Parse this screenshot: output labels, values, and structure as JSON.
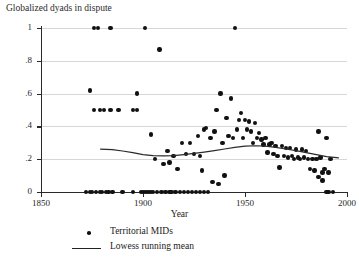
{
  "chart_data": {
    "type": "scatter",
    "title": "Globalized dyads in dispute",
    "xlabel": "Year",
    "ylabel": "",
    "xlim": [
      1850,
      2000
    ],
    "ylim": [
      0,
      1
    ],
    "grid": true,
    "legend_position": "below-axis",
    "xticks": [
      1850,
      1900,
      1950,
      2000
    ],
    "xtick_labels": [
      "1850",
      "1900",
      "1950",
      "2000"
    ],
    "yticks": [
      0,
      0.2,
      0.4,
      0.6,
      0.8,
      1
    ],
    "ytick_labels": [
      "0",
      ".2",
      ".4",
      ".6",
      ".8",
      "1"
    ],
    "legend": [
      {
        "label": "Territorial MIDs",
        "marker": "dot"
      },
      {
        "label": "Lowess running mean",
        "marker": "line"
      }
    ],
    "series": [
      {
        "name": "Territorial MIDs",
        "marker": "dot",
        "color": "#111111",
        "points": [
          [
            1876,
            1.0
          ],
          [
            1878,
            1.0
          ],
          [
            1884,
            1.0
          ],
          [
            1901,
            1.0
          ],
          [
            1945,
            1.0
          ],
          [
            1908,
            0.87
          ],
          [
            1874,
            0.62
          ],
          [
            1897,
            0.6
          ],
          [
            1938,
            0.6
          ],
          [
            1943,
            0.57
          ],
          [
            1876,
            0.5
          ],
          [
            1879,
            0.5
          ],
          [
            1881,
            0.5
          ],
          [
            1884,
            0.5
          ],
          [
            1888,
            0.5
          ],
          [
            1895,
            0.5
          ],
          [
            1897,
            0.5
          ],
          [
            1936,
            0.5
          ],
          [
            1948,
            0.48
          ],
          [
            1941,
            0.45
          ],
          [
            1947,
            0.44
          ],
          [
            1950,
            0.44
          ],
          [
            1952,
            0.43
          ],
          [
            1955,
            0.42
          ],
          [
            1930,
            0.38
          ],
          [
            1931,
            0.39
          ],
          [
            1935,
            0.37
          ],
          [
            1946,
            0.38
          ],
          [
            1951,
            0.38
          ],
          [
            1953,
            0.37
          ],
          [
            1957,
            0.36
          ],
          [
            1986,
            0.37
          ],
          [
            1904,
            0.35
          ],
          [
            1927,
            0.34
          ],
          [
            1933,
            0.33
          ],
          [
            1942,
            0.34
          ],
          [
            1944,
            0.33
          ],
          [
            1949,
            0.33
          ],
          [
            1956,
            0.33
          ],
          [
            1958,
            0.32
          ],
          [
            1960,
            0.33
          ],
          [
            1990,
            0.33
          ],
          [
            1919,
            0.3
          ],
          [
            1923,
            0.3
          ],
          [
            1939,
            0.3
          ],
          [
            1954,
            0.3
          ],
          [
            1959,
            0.29
          ],
          [
            1962,
            0.29
          ],
          [
            1963,
            0.3
          ],
          [
            1965,
            0.28
          ],
          [
            1968,
            0.28
          ],
          [
            1970,
            0.27
          ],
          [
            1972,
            0.27
          ],
          [
            1975,
            0.26
          ],
          [
            1978,
            0.26
          ],
          [
            1980,
            0.25
          ],
          [
            1912,
            0.25
          ],
          [
            1915,
            0.22
          ],
          [
            1921,
            0.23
          ],
          [
            1925,
            0.23
          ],
          [
            1928,
            0.22
          ],
          [
            1961,
            0.24
          ],
          [
            1964,
            0.23
          ],
          [
            1966,
            0.22
          ],
          [
            1969,
            0.22
          ],
          [
            1971,
            0.21
          ],
          [
            1973,
            0.22
          ],
          [
            1974,
            0.2
          ],
          [
            1976,
            0.21
          ],
          [
            1977,
            0.2
          ],
          [
            1979,
            0.21
          ],
          [
            1981,
            0.2
          ],
          [
            1983,
            0.2
          ],
          [
            1985,
            0.2
          ],
          [
            1987,
            0.21
          ],
          [
            1992,
            0.2
          ],
          [
            1906,
            0.2
          ],
          [
            1910,
            0.17
          ],
          [
            1913,
            0.18
          ],
          [
            1917,
            0.14
          ],
          [
            1929,
            0.13
          ],
          [
            1967,
            0.15
          ],
          [
            1982,
            0.14
          ],
          [
            1984,
            0.13
          ],
          [
            1988,
            0.12
          ],
          [
            1989,
            0.14
          ],
          [
            1991,
            0.12
          ],
          [
            1940,
            0.1
          ],
          [
            1986,
            0.09
          ],
          [
            1988,
            0.07
          ],
          [
            1934,
            0.06
          ],
          [
            1937,
            0.05
          ],
          [
            1872,
            0.0
          ],
          [
            1874,
            0.0
          ],
          [
            1875,
            0.0
          ],
          [
            1877,
            0.0
          ],
          [
            1879,
            0.0
          ],
          [
            1880,
            0.0
          ],
          [
            1882,
            0.0
          ],
          [
            1883,
            0.0
          ],
          [
            1885,
            0.0
          ],
          [
            1890,
            0.0
          ],
          [
            1895,
            0.0
          ],
          [
            1899,
            0.0
          ],
          [
            1900,
            0.0
          ],
          [
            1901,
            0.0
          ],
          [
            1902,
            0.0
          ],
          [
            1903,
            0.0
          ],
          [
            1904,
            0.0
          ],
          [
            1905,
            0.0
          ],
          [
            1907,
            0.0
          ],
          [
            1909,
            0.0
          ],
          [
            1911,
            0.0
          ],
          [
            1913,
            0.0
          ],
          [
            1914,
            0.0
          ],
          [
            1916,
            0.0
          ],
          [
            1918,
            0.0
          ],
          [
            1920,
            0.0
          ],
          [
            1922,
            0.0
          ],
          [
            1924,
            0.0
          ],
          [
            1926,
            0.0
          ],
          [
            1928,
            0.0
          ],
          [
            1930,
            0.0
          ],
          [
            1932,
            0.0
          ],
          [
            1990,
            0.0
          ],
          [
            1991,
            0.0
          ],
          [
            1993,
            0.0
          ]
        ]
      },
      {
        "name": "Lowess running mean",
        "marker": "line",
        "color": "#2a2a2a",
        "points": [
          [
            1879,
            0.262
          ],
          [
            1885,
            0.258
          ],
          [
            1890,
            0.25
          ],
          [
            1895,
            0.24
          ],
          [
            1900,
            0.228
          ],
          [
            1905,
            0.222
          ],
          [
            1910,
            0.22
          ],
          [
            1915,
            0.222
          ],
          [
            1920,
            0.228
          ],
          [
            1925,
            0.235
          ],
          [
            1930,
            0.243
          ],
          [
            1935,
            0.252
          ],
          [
            1940,
            0.262
          ],
          [
            1945,
            0.272
          ],
          [
            1950,
            0.28
          ],
          [
            1955,
            0.282
          ],
          [
            1960,
            0.28
          ],
          [
            1965,
            0.272
          ],
          [
            1970,
            0.262
          ],
          [
            1975,
            0.252
          ],
          [
            1980,
            0.24
          ],
          [
            1985,
            0.228
          ],
          [
            1990,
            0.216
          ],
          [
            1996,
            0.208
          ]
        ]
      }
    ]
  },
  "caption": ""
}
